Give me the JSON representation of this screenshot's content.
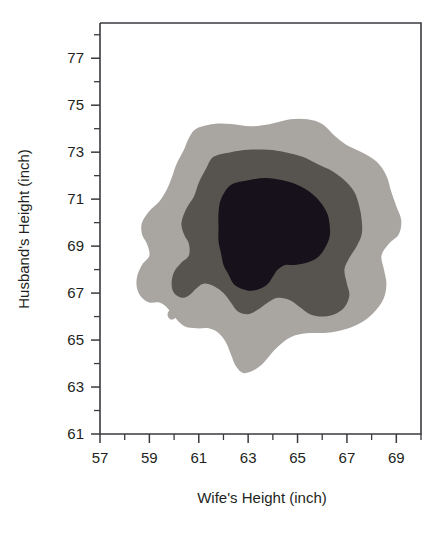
{
  "chart_data": {
    "type": "contour",
    "title": "",
    "xlabel": "Wife's Height (inch)",
    "ylabel": "Husband's Height (inch)",
    "xlim": [
      57,
      70
    ],
    "ylim": [
      61,
      78.5
    ],
    "xticks": [
      57,
      59,
      61,
      63,
      65,
      67,
      69
    ],
    "yticks": [
      61,
      63,
      65,
      67,
      69,
      71,
      73,
      75,
      77
    ],
    "xtick_labels": [
      "57",
      "59",
      "61",
      "63",
      "65",
      "67",
      "69"
    ],
    "ytick_labels": [
      "61",
      "63",
      "65",
      "67",
      "69",
      "71",
      "73",
      "75",
      "77"
    ],
    "x_minor_tick_interval": 1,
    "y_minor_tick_interval": 1,
    "grid": false,
    "legend": "none",
    "levels": [
      {
        "name": "outer",
        "label": "lowest density band",
        "color": "#a9a6a2"
      },
      {
        "name": "middle",
        "label": "medium density band",
        "color": "#57544f"
      },
      {
        "name": "inner",
        "label": "highest density core",
        "color": "#16111a"
      }
    ],
    "peak_center": [
      63.7,
      69.6
    ],
    "bands": {
      "outer": [
        [
          60.9,
          74.0
        ],
        [
          61.6,
          74.2
        ],
        [
          62.3,
          74.2
        ],
        [
          63.1,
          74.1
        ],
        [
          63.9,
          74.2
        ],
        [
          64.7,
          74.4
        ],
        [
          65.4,
          74.4
        ],
        [
          66.0,
          74.2
        ],
        [
          66.5,
          73.7
        ],
        [
          67.0,
          73.3
        ],
        [
          67.6,
          73.0
        ],
        [
          68.2,
          72.6
        ],
        [
          68.6,
          72.0
        ],
        [
          68.8,
          71.3
        ],
        [
          69.0,
          70.7
        ],
        [
          69.2,
          70.1
        ],
        [
          69.1,
          69.5
        ],
        [
          68.7,
          69.1
        ],
        [
          68.4,
          68.6
        ],
        [
          68.5,
          68.0
        ],
        [
          68.6,
          67.4
        ],
        [
          68.5,
          66.8
        ],
        [
          68.2,
          66.3
        ],
        [
          67.8,
          65.9
        ],
        [
          67.3,
          65.6
        ],
        [
          66.7,
          65.4
        ],
        [
          66.1,
          65.3
        ],
        [
          65.5,
          65.3
        ],
        [
          64.9,
          65.2
        ],
        [
          64.4,
          64.9
        ],
        [
          64.0,
          64.5
        ],
        [
          63.6,
          64.0
        ],
        [
          63.2,
          63.7
        ],
        [
          62.8,
          63.6
        ],
        [
          62.5,
          63.9
        ],
        [
          62.3,
          64.4
        ],
        [
          62.1,
          64.9
        ],
        [
          61.8,
          65.3
        ],
        [
          61.4,
          65.5
        ],
        [
          60.9,
          65.5
        ],
        [
          60.4,
          65.6
        ],
        [
          60.0,
          66.0
        ],
        [
          59.7,
          66.4
        ],
        [
          59.4,
          66.6
        ],
        [
          59.0,
          66.6
        ],
        [
          58.7,
          66.8
        ],
        [
          58.5,
          67.2
        ],
        [
          58.5,
          67.7
        ],
        [
          58.7,
          68.2
        ],
        [
          59.0,
          68.6
        ],
        [
          58.9,
          69.1
        ],
        [
          58.7,
          69.5
        ],
        [
          58.7,
          70.0
        ],
        [
          59.0,
          70.5
        ],
        [
          59.4,
          70.9
        ],
        [
          59.7,
          71.4
        ],
        [
          59.9,
          71.9
        ],
        [
          60.1,
          72.5
        ],
        [
          60.4,
          73.1
        ],
        [
          60.6,
          73.6
        ]
      ],
      "middle": [
        [
          61.6,
          72.8
        ],
        [
          62.3,
          73.0
        ],
        [
          63.0,
          73.1
        ],
        [
          63.8,
          73.1
        ],
        [
          64.5,
          73.0
        ],
        [
          65.2,
          72.8
        ],
        [
          65.8,
          72.5
        ],
        [
          66.4,
          72.2
        ],
        [
          66.9,
          71.8
        ],
        [
          67.3,
          71.3
        ],
        [
          67.5,
          70.7
        ],
        [
          67.6,
          70.1
        ],
        [
          67.6,
          69.5
        ],
        [
          67.4,
          69.0
        ],
        [
          67.1,
          68.5
        ],
        [
          66.9,
          68.0
        ],
        [
          67.0,
          67.4
        ],
        [
          67.1,
          66.9
        ],
        [
          66.9,
          66.4
        ],
        [
          66.5,
          66.1
        ],
        [
          66.0,
          66.0
        ],
        [
          65.5,
          66.1
        ],
        [
          65.1,
          66.4
        ],
        [
          64.7,
          66.7
        ],
        [
          64.2,
          66.8
        ],
        [
          63.8,
          66.6
        ],
        [
          63.4,
          66.3
        ],
        [
          63.0,
          66.1
        ],
        [
          62.6,
          66.2
        ],
        [
          62.3,
          66.6
        ],
        [
          62.0,
          67.0
        ],
        [
          61.6,
          67.3
        ],
        [
          61.2,
          67.4
        ],
        [
          60.9,
          67.2
        ],
        [
          60.6,
          66.9
        ],
        [
          60.3,
          66.8
        ],
        [
          60.0,
          67.0
        ],
        [
          59.9,
          67.4
        ],
        [
          60.0,
          67.9
        ],
        [
          60.3,
          68.3
        ],
        [
          60.6,
          68.6
        ],
        [
          60.6,
          69.1
        ],
        [
          60.4,
          69.5
        ],
        [
          60.3,
          70.0
        ],
        [
          60.5,
          70.6
        ],
        [
          60.8,
          71.1
        ],
        [
          61.0,
          71.7
        ],
        [
          61.3,
          72.3
        ]
      ],
      "inner": [
        [
          62.3,
          71.6
        ],
        [
          63.0,
          71.8
        ],
        [
          63.7,
          71.9
        ],
        [
          64.4,
          71.8
        ],
        [
          65.0,
          71.6
        ],
        [
          65.5,
          71.3
        ],
        [
          65.9,
          70.9
        ],
        [
          66.2,
          70.4
        ],
        [
          66.3,
          69.9
        ],
        [
          66.3,
          69.4
        ],
        [
          66.1,
          68.9
        ],
        [
          65.8,
          68.5
        ],
        [
          65.4,
          68.3
        ],
        [
          64.9,
          68.2
        ],
        [
          64.5,
          68.2
        ],
        [
          64.2,
          68.0
        ],
        [
          64.0,
          67.7
        ],
        [
          63.8,
          67.4
        ],
        [
          63.5,
          67.2
        ],
        [
          63.1,
          67.1
        ],
        [
          62.7,
          67.2
        ],
        [
          62.4,
          67.4
        ],
        [
          62.2,
          67.8
        ],
        [
          62.0,
          68.2
        ],
        [
          61.9,
          68.7
        ],
        [
          61.8,
          69.2
        ],
        [
          61.8,
          69.8
        ],
        [
          61.8,
          70.4
        ],
        [
          61.9,
          71.0
        ]
      ],
      "island_outer": [
        [
          59.8,
          66.25
        ],
        [
          59.95,
          66.32
        ],
        [
          60.05,
          66.22
        ],
        [
          60.08,
          66.05
        ],
        [
          60.0,
          65.9
        ],
        [
          59.85,
          65.88
        ],
        [
          59.75,
          66.0
        ],
        [
          59.74,
          66.14
        ]
      ]
    }
  },
  "axes": {
    "x_title": "Wife's Height (inch)",
    "y_title": "Husband's Height (inch)"
  }
}
